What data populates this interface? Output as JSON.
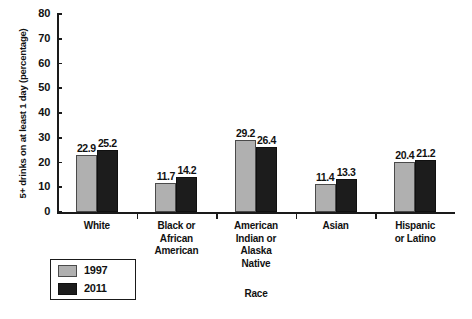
{
  "chart_data": {
    "type": "bar",
    "title": "",
    "subtitle": "",
    "xlabel": "Race",
    "ylabel": "5+ drinks on at least 1 day (percentage)",
    "categories": [
      "White",
      "Black or African American",
      "American Indian or Alaska Native",
      "Asian",
      "Hispanic or Latino"
    ],
    "category_lines": [
      [
        "White"
      ],
      [
        "Black or",
        "African",
        "American"
      ],
      [
        "American",
        "Indian or",
        "Alaska",
        "Native"
      ],
      [
        "Asian"
      ],
      [
        "Hispanic",
        "or Latino"
      ]
    ],
    "series": [
      {
        "name": "1997",
        "color": "#b0b0b0",
        "values": [
          22.9,
          11.7,
          29.2,
          11.4,
          20.4
        ],
        "labels": [
          "22.9",
          "11.7",
          "29.2",
          "11.4",
          "20.4"
        ]
      },
      {
        "name": "2011",
        "color": "#1c1c1c",
        "values": [
          25.2,
          14.2,
          26.4,
          13.3,
          21.2
        ],
        "labels": [
          "25.2",
          "14.2",
          "26.4",
          "13.3",
          "21.2"
        ]
      }
    ],
    "ylim": [
      0,
      80
    ],
    "ytick_values": [
      0,
      10,
      20,
      30,
      40,
      50,
      60,
      70,
      80
    ],
    "ytick_labels": [
      "0",
      "10",
      "20",
      "30",
      "40",
      "50",
      "60",
      "70",
      "80"
    ],
    "grid": false,
    "legend_position": "bottom-left",
    "legend_entries": [
      "1997",
      "2011"
    ]
  },
  "footer": {
    "fragment": ""
  }
}
